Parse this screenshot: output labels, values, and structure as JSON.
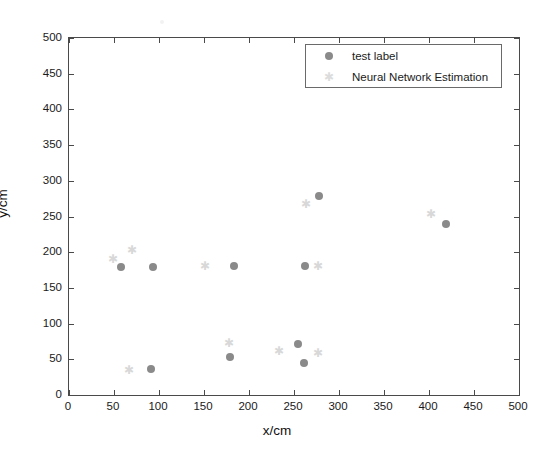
{
  "chart_data": {
    "type": "scatter",
    "title": "",
    "xlabel": "x/cm",
    "ylabel": "y/cm",
    "xlim": [
      0,
      500
    ],
    "ylim": [
      0,
      500
    ],
    "xticks": [
      0,
      50,
      100,
      150,
      200,
      250,
      300,
      350,
      400,
      450,
      500
    ],
    "yticks": [
      0,
      50,
      100,
      150,
      200,
      250,
      300,
      350,
      400,
      450,
      500
    ],
    "grid": false,
    "legend_position": "top-right",
    "series": [
      {
        "name": "test label",
        "marker": "filled-circle",
        "color": "#8a8a8a",
        "points": [
          {
            "x": 58,
            "y": 179
          },
          {
            "x": 93,
            "y": 179
          },
          {
            "x": 91,
            "y": 36
          },
          {
            "x": 183,
            "y": 180
          },
          {
            "x": 179,
            "y": 53
          },
          {
            "x": 254,
            "y": 71
          },
          {
            "x": 261,
            "y": 45
          },
          {
            "x": 262,
            "y": 181
          },
          {
            "x": 278,
            "y": 279
          },
          {
            "x": 419,
            "y": 239
          }
        ]
      },
      {
        "name": "Neural Network Estimation",
        "marker": "star",
        "color": "#d8d8d8",
        "points": [
          {
            "x": 49,
            "y": 190
          },
          {
            "x": 70,
            "y": 203
          },
          {
            "x": 67,
            "y": 35
          },
          {
            "x": 151,
            "y": 180
          },
          {
            "x": 178,
            "y": 73
          },
          {
            "x": 233,
            "y": 62
          },
          {
            "x": 277,
            "y": 59
          },
          {
            "x": 263,
            "y": 267
          },
          {
            "x": 277,
            "y": 181
          },
          {
            "x": 402,
            "y": 254
          }
        ]
      }
    ]
  },
  "legend": {
    "entries": [
      {
        "label": "test label",
        "marker": "filled-circle"
      },
      {
        "label": "Neural Network Estimation",
        "marker": "star"
      }
    ]
  },
  "axes": {
    "x_title": "x/cm",
    "y_title": "y/cm"
  },
  "colors": {
    "test_label_marker": "#8a8a8a",
    "estimation_marker": "#d8d8d8",
    "axis": "#4a4a4a",
    "text": "#1a1a1a",
    "background": "#ffffff"
  }
}
